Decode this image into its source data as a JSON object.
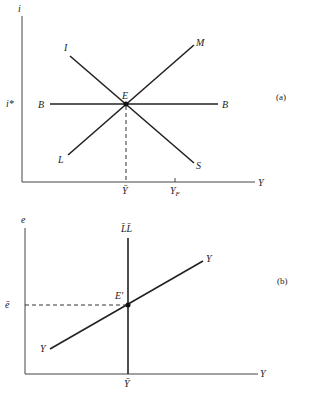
{
  "panel_a": {
    "label": "(a)",
    "y_axis_label": "i",
    "x_axis_label": "Y",
    "i_star_label": "i*",
    "equilibrium_label": "E",
    "curves": {
      "BB": {
        "left": "B",
        "right": "B"
      },
      "IS": {
        "start": "I",
        "end": "S"
      },
      "LM": {
        "start": "L",
        "end": "M"
      }
    },
    "y_bar_label": "Ȳ",
    "y_f_label": "Y",
    "y_f_sub": "F"
  },
  "panel_b": {
    "label": "(b)",
    "y_axis_label": "e",
    "x_axis_label": "Y",
    "e_bar_label": "ē",
    "equilibrium_label": "E′",
    "ll_label": "L̄L̄",
    "yy_start": "Y",
    "yy_end": "Y",
    "y_bar_label": "Ȳ"
  }
}
